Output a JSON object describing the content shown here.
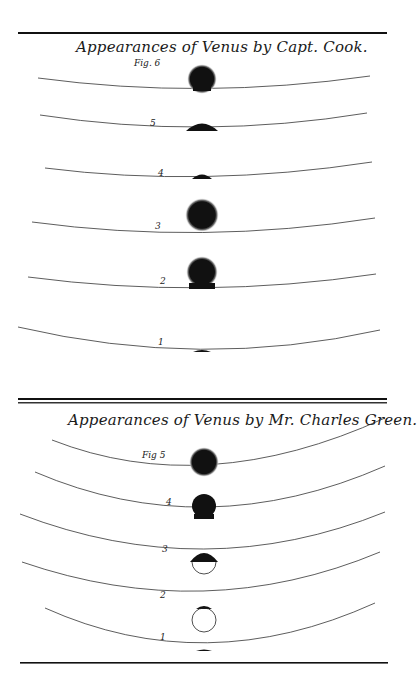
{
  "plate": {
    "top_crop_text": "",
    "sections": [
      {
        "id": "cook",
        "title": "Appearances of Venus by Capt. Cook.",
        "figures": [
          {
            "label": "Fig. 6",
            "y": 66,
            "phase": "detached-with-ligament"
          },
          {
            "label": "5",
            "y": 129,
            "phase": "partial-ingress-small"
          },
          {
            "label": "4",
            "y": 178,
            "phase": "partial-ingress-smaller"
          },
          {
            "label": "3",
            "y": 217,
            "phase": "fully-detached"
          },
          {
            "label": "2",
            "y": 273,
            "phase": "black-drop"
          },
          {
            "label": "1",
            "y": 345,
            "phase": "first-contact"
          }
        ]
      },
      {
        "id": "green",
        "title": "Appearances of Venus by Mr. Charles Green.",
        "figures": [
          {
            "label": "Fig 5",
            "y": 460,
            "phase": "fully-detached"
          },
          {
            "label": "4",
            "y": 505,
            "phase": "black-drop"
          },
          {
            "label": "3",
            "y": 548,
            "phase": "half-ingress"
          },
          {
            "label": "2",
            "y": 594,
            "phase": "near-first-contact"
          },
          {
            "label": "1",
            "y": 648,
            "phase": "first-contact"
          }
        ]
      }
    ]
  },
  "colors": {
    "ink": "#111111",
    "halo": "#9a9a9a",
    "paper": "#ffffff"
  }
}
